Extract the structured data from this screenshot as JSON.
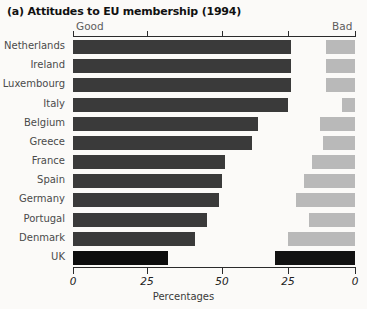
{
  "figure": {
    "panel_letter": "(a)",
    "title": "(a) Attitudes to EU membership (1994)",
    "good_caption": "Good",
    "bad_caption": "Bad",
    "xlabel": "Percentages",
    "highlight_country": "UK",
    "colors": {
      "good_bar": "#3a3a3a",
      "bad_bar": "#b9b9b9",
      "highlight_bar": "#0d0d0d",
      "axis": "#2b2b2b",
      "background": "#fbfaf8",
      "label_text": "#4a4a4a"
    }
  },
  "axis": {
    "ticks": [
      {
        "label": "0",
        "x_px": 73
      },
      {
        "label": "25",
        "x_px": 147
      },
      {
        "label": "50",
        "x_px": 222
      },
      {
        "label": "25",
        "x_px": 288
      },
      {
        "label": "0",
        "x_px": 355
      }
    ]
  },
  "chart_data": {
    "type": "bar",
    "orientation": "horizontal-diverging",
    "title": "(a) Attitudes to EU membership (1994)",
    "xlabel": "Percentages",
    "ylabel": "",
    "grid": false,
    "legend": [
      "Good",
      "Bad"
    ],
    "legend_position": "top (axis ends)",
    "categories": [
      "Netherlands",
      "Ireland",
      "Luxembourg",
      "Italy",
      "Belgium",
      "Greece",
      "France",
      "Spain",
      "Germany",
      "Portugal",
      "Denmark",
      "UK"
    ],
    "series": [
      {
        "name": "Good",
        "axis": "left",
        "xlim": [
          0,
          75
        ],
        "values": [
          73,
          73,
          73,
          72,
          62,
          60,
          51,
          50,
          49,
          45,
          41,
          32
        ]
      },
      {
        "name": "Bad",
        "axis": "right",
        "xlim": [
          0,
          30
        ],
        "values": [
          11,
          11,
          11,
          5,
          13,
          12,
          16,
          19,
          22,
          17,
          25,
          30
        ]
      }
    ]
  }
}
